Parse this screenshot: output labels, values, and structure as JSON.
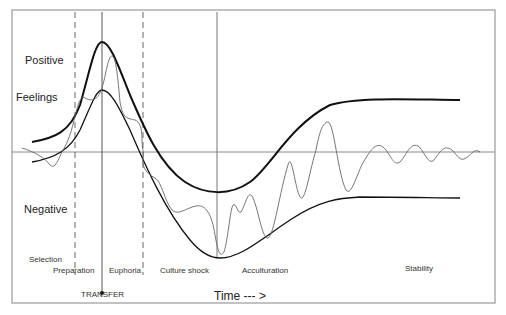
{
  "diagram": {
    "type": "curve-diagram",
    "title": "",
    "y_labels": {
      "positive": "Positive",
      "feelings": "Feelings",
      "negative": "Negative"
    },
    "x_axis_label": "Time --- >",
    "event_marker": "TRANSFER",
    "phases": [
      {
        "name": "Selection"
      },
      {
        "name": "Preparation"
      },
      {
        "name": "Euphoria"
      },
      {
        "name": "Culture shock"
      },
      {
        "name": "Acculturation"
      },
      {
        "name": "Stability"
      }
    ],
    "curves": [
      {
        "name": "upper-envelope",
        "style": "thick black"
      },
      {
        "name": "lower-envelope",
        "style": "black"
      },
      {
        "name": "feelings-oscillation",
        "style": "thin gray"
      }
    ],
    "colors": {
      "frame": "#9a9a9a",
      "axis": "#8a8a8a",
      "curve": "#1a1a1a",
      "oscillation": "#666666",
      "text": "#222222"
    }
  }
}
